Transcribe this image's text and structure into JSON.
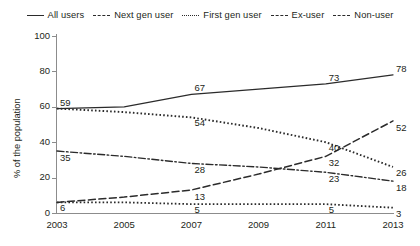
{
  "legend": {
    "entries": [
      {
        "label": "All users",
        "style": "solid",
        "icon": "line-solid-icon"
      },
      {
        "label": "Next gen user",
        "style": "dashed",
        "icon": "line-dashed-icon"
      },
      {
        "label": "First gen user",
        "style": "dotted",
        "icon": "line-dotted-icon"
      },
      {
        "label": "Ex-user",
        "style": "dashdot",
        "icon": "line-dashdot-icon"
      },
      {
        "label": "Non-user",
        "style": "dashed",
        "icon": "line-longdash-icon"
      }
    ]
  },
  "axes": {
    "ylabel": "% of the population",
    "yticks": [
      "0",
      "20",
      "40",
      "60",
      "80",
      "100"
    ],
    "xticks": [
      "2003",
      "2005",
      "2007",
      "2009",
      "2011",
      "2013"
    ]
  },
  "colors": {
    "line": "#2b2b2b",
    "axis": "#8c8c8c",
    "text": "#231f20",
    "background": "#ffffff"
  },
  "chart_data": {
    "type": "line",
    "title": "",
    "xlabel": "",
    "ylabel": "% of the population",
    "x": [
      2003,
      2005,
      2007,
      2009,
      2011,
      2013
    ],
    "xlim": [
      2003,
      2013
    ],
    "ylim": [
      0,
      100
    ],
    "grid": false,
    "legend_position": "top",
    "series": [
      {
        "name": "All users",
        "style": "solid",
        "values": [
          59,
          60,
          67,
          70,
          73,
          78
        ],
        "labels": [
          {
            "x": 2003,
            "y": 59,
            "text": "59"
          },
          {
            "x": 2007,
            "y": 67,
            "text": "67"
          },
          {
            "x": 2011,
            "y": 73,
            "text": "73"
          },
          {
            "x": 2013,
            "y": 78,
            "text": "78"
          }
        ]
      },
      {
        "name": "Next gen user",
        "style": "dashed",
        "values": [
          6,
          9,
          13,
          22,
          32,
          52
        ],
        "labels": [
          {
            "x": 2007,
            "y": 13,
            "text": "13"
          },
          {
            "x": 2011,
            "y": 32,
            "text": "32"
          },
          {
            "x": 2013,
            "y": 52,
            "text": "52"
          }
        ]
      },
      {
        "name": "First gen user",
        "style": "dotted",
        "values": [
          59,
          57,
          54,
          48,
          40,
          26
        ],
        "labels": [
          {
            "x": 2007,
            "y": 54,
            "text": "54"
          },
          {
            "x": 2011,
            "y": 40,
            "text": "40"
          },
          {
            "x": 2013,
            "y": 26,
            "text": "26"
          }
        ]
      },
      {
        "name": "Ex-user",
        "style": "dashdot",
        "values": [
          35,
          32,
          28,
          26,
          23,
          18
        ],
        "labels": [
          {
            "x": 2003,
            "y": 35,
            "text": "35"
          },
          {
            "x": 2007,
            "y": 28,
            "text": "28"
          },
          {
            "x": 2011,
            "y": 23,
            "text": "23"
          },
          {
            "x": 2013,
            "y": 18,
            "text": "18"
          }
        ]
      },
      {
        "name": "Non-user",
        "style": "longdash",
        "values": [
          6,
          6,
          5,
          5,
          5,
          3
        ],
        "labels": [
          {
            "x": 2003,
            "y": 6,
            "text": "6"
          },
          {
            "x": 2007,
            "y": 5,
            "text": "5"
          },
          {
            "x": 2011,
            "y": 5,
            "text": "5"
          },
          {
            "x": 2013,
            "y": 3,
            "text": "3"
          }
        ]
      }
    ]
  }
}
